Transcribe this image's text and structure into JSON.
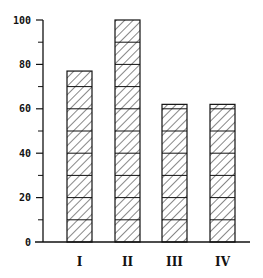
{
  "chart_data": {
    "type": "bar",
    "title": "",
    "xlabel": "",
    "ylabel": "",
    "categories": [
      "I",
      "II",
      "III",
      "IV"
    ],
    "values": [
      77,
      100,
      62,
      62
    ],
    "ylim": [
      0,
      100
    ],
    "yticks_major": [
      0,
      20,
      40,
      60,
      80,
      100
    ],
    "ytick_labels": [
      "0",
      "20",
      "40",
      "60",
      "80",
      "100"
    ],
    "yticks_minor": [
      10,
      30,
      50,
      70,
      90
    ],
    "segment_size": 10,
    "grid": false,
    "legend": null,
    "bar_style": "stacked segments of 10 units with diagonal hatching",
    "colors": {
      "stroke": "#111111",
      "fill": "#ffffff"
    }
  }
}
